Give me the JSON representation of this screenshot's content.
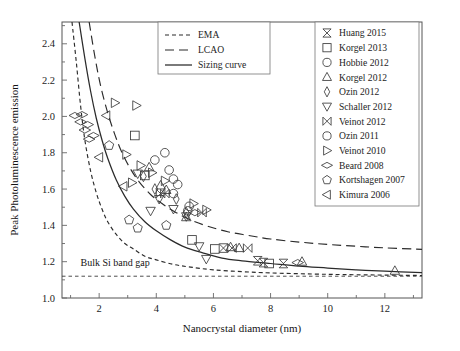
{
  "chart_data": {
    "type": "scatter",
    "title": "",
    "xlabel": "Nanocrystal diameter (nm)",
    "ylabel": "Peak Photoluminescence emission",
    "xlim": [
      0.7,
      13.3
    ],
    "ylim": [
      1.0,
      2.52
    ],
    "xticks": [
      2,
      4,
      6,
      8,
      10,
      12
    ],
    "xtick_labels": [
      "2",
      "4",
      "6",
      "8",
      "10",
      "12"
    ],
    "xminorticks": [
      1,
      3,
      5,
      7,
      9,
      11,
      13
    ],
    "yticks": [
      1.0,
      1.2,
      1.4,
      1.6,
      1.8,
      2.0,
      2.2,
      2.4
    ],
    "ytick_labels": [
      "1.0",
      "1.2",
      "1.4",
      "1.6",
      "1.8",
      "2.0",
      "2.2",
      "2.4"
    ],
    "yminorticks": [
      1.1,
      1.3,
      1.5,
      1.7,
      1.9,
      2.1,
      2.3,
      2.5
    ],
    "grid": false,
    "annotations": [
      {
        "text": "Bulk Si band gap",
        "x": 1.35,
        "y": 1.175
      }
    ],
    "reference_lines": [
      {
        "name": "bulk-si-band-gap",
        "type": "hline",
        "y": 1.12,
        "style": "dotted"
      }
    ],
    "curves": [
      {
        "name": "EMA",
        "style": "dashed-short",
        "points": [
          [
            1.05,
            2.52
          ],
          [
            1.2,
            2.3
          ],
          [
            1.35,
            2.06
          ],
          [
            1.5,
            1.87
          ],
          [
            1.7,
            1.7
          ],
          [
            1.9,
            1.58
          ],
          [
            2.1,
            1.49
          ],
          [
            2.3,
            1.42
          ],
          [
            2.6,
            1.35
          ],
          [
            2.9,
            1.3
          ],
          [
            3.2,
            1.27
          ],
          [
            3.6,
            1.23
          ],
          [
            4.0,
            1.21
          ],
          [
            4.6,
            1.185
          ],
          [
            5.2,
            1.17
          ],
          [
            6.0,
            1.155
          ],
          [
            7.0,
            1.145
          ],
          [
            8.0,
            1.138
          ],
          [
            9.5,
            1.132
          ],
          [
            11.0,
            1.128
          ],
          [
            13.3,
            1.124
          ]
        ]
      },
      {
        "name": "Sizing curve",
        "style": "solid",
        "points": [
          [
            1.3,
            2.52
          ],
          [
            1.5,
            2.32
          ],
          [
            1.7,
            2.14
          ],
          [
            1.9,
            1.99
          ],
          [
            2.1,
            1.87
          ],
          [
            2.3,
            1.77
          ],
          [
            2.6,
            1.65
          ],
          [
            2.9,
            1.56
          ],
          [
            3.2,
            1.49
          ],
          [
            3.6,
            1.42
          ],
          [
            4.0,
            1.37
          ],
          [
            4.5,
            1.32
          ],
          [
            5.0,
            1.28
          ],
          [
            5.6,
            1.25
          ],
          [
            6.3,
            1.22
          ],
          [
            7.0,
            1.205
          ],
          [
            8.0,
            1.19
          ],
          [
            9.0,
            1.175
          ],
          [
            10.0,
            1.165
          ],
          [
            11.0,
            1.155
          ],
          [
            12.0,
            1.148
          ],
          [
            13.3,
            1.14
          ]
        ]
      },
      {
        "name": "LCAO",
        "style": "dashed-long",
        "points": [
          [
            1.65,
            2.52
          ],
          [
            1.85,
            2.33
          ],
          [
            2.05,
            2.17
          ],
          [
            2.3,
            2.02
          ],
          [
            2.55,
            1.9
          ],
          [
            2.8,
            1.8
          ],
          [
            3.1,
            1.71
          ],
          [
            3.4,
            1.64
          ],
          [
            3.8,
            1.57
          ],
          [
            4.2,
            1.52
          ],
          [
            4.7,
            1.47
          ],
          [
            5.2,
            1.43
          ],
          [
            5.8,
            1.395
          ],
          [
            6.5,
            1.365
          ],
          [
            7.2,
            1.345
          ],
          [
            8.0,
            1.325
          ],
          [
            9.0,
            1.308
          ],
          [
            10.0,
            1.295
          ],
          [
            11.0,
            1.285
          ],
          [
            12.0,
            1.276
          ],
          [
            13.3,
            1.268
          ]
        ]
      }
    ],
    "series": [
      {
        "name": "Huang 2015",
        "marker": "bowtie-v",
        "points": [
          [
            6.35,
            1.275
          ],
          [
            7.55,
            1.205
          ],
          [
            7.75,
            1.195
          ],
          [
            8.45,
            1.19
          ]
        ]
      },
      {
        "name": "Korgel 2013",
        "marker": "square",
        "points": [
          [
            3.25,
            1.895
          ],
          [
            3.6,
            1.675
          ],
          [
            5.25,
            1.32
          ],
          [
            6.05,
            1.27
          ],
          [
            7.95,
            1.19
          ]
        ]
      },
      {
        "name": "Hobbie 2012",
        "marker": "circle",
        "points": [
          [
            4.3,
            1.8
          ],
          [
            4.45,
            1.705
          ],
          [
            4.6,
            1.655
          ],
          [
            4.75,
            1.625
          ],
          [
            3.95,
            1.76
          ]
        ]
      },
      {
        "name": "Korgel 2012",
        "marker": "triangle-up",
        "points": [
          [
            3.75,
            1.72
          ],
          [
            4.15,
            1.62
          ],
          [
            4.35,
            1.595
          ],
          [
            5.05,
            1.445
          ],
          [
            6.6,
            1.28
          ],
          [
            6.9,
            1.275
          ],
          [
            9.1,
            1.2
          ],
          [
            12.35,
            1.15
          ]
        ]
      },
      {
        "name": "Ozin 2012",
        "marker": "diamond-narrow",
        "points": [
          [
            3.55,
            1.67
          ],
          [
            3.95,
            1.6
          ],
          [
            4.7,
            1.545
          ],
          [
            5.05,
            1.47
          ]
        ]
      },
      {
        "name": "Schaller 2012",
        "marker": "triangle-down",
        "points": [
          [
            3.35,
            1.685
          ],
          [
            4.1,
            1.545
          ],
          [
            4.6,
            1.49
          ],
          [
            5.05,
            1.45
          ],
          [
            5.5,
            1.285
          ],
          [
            5.75,
            1.215
          ],
          [
            3.8,
            1.48
          ]
        ]
      },
      {
        "name": "Veinot 2012",
        "marker": "bowtie-h",
        "points": [
          [
            4.15,
            1.575
          ],
          [
            4.3,
            1.575
          ],
          [
            5.6,
            1.47
          ],
          [
            6.65,
            1.275
          ],
          [
            7.2,
            1.275
          ]
        ]
      },
      {
        "name": "Ozin 2011",
        "marker": "circle-open",
        "points": [
          [
            4.6,
            1.575
          ],
          [
            5.15,
            1.505
          ],
          [
            5.1,
            1.48
          ]
        ]
      },
      {
        "name": "Veinot 2010",
        "marker": "triangle-right",
        "points": [
          [
            2.55,
            2.075
          ],
          [
            3.3,
            2.06
          ],
          [
            2.95,
            1.79
          ],
          [
            3.45,
            1.73
          ],
          [
            3.85,
            1.69
          ],
          [
            4.3,
            1.645
          ],
          [
            5.3,
            1.52
          ],
          [
            5.75,
            1.485
          ],
          [
            3.15,
            1.635
          ]
        ]
      },
      {
        "name": "Beard 2008",
        "marker": "diamond-wide",
        "points": [
          [
            1.15,
            2.005
          ],
          [
            1.35,
            1.97
          ],
          [
            1.5,
            1.925
          ],
          [
            1.65,
            1.875
          ],
          [
            1.4,
            2.01
          ],
          [
            1.6,
            1.955
          ],
          [
            1.8,
            1.895
          ],
          [
            5.35,
            1.47
          ],
          [
            8.95,
            1.195
          ]
        ]
      },
      {
        "name": "Kortshagen 2007",
        "marker": "pentagon",
        "points": [
          [
            2.35,
            1.84
          ],
          [
            3.05,
            1.43
          ],
          [
            4.35,
            1.4
          ],
          [
            3.35,
            1.385
          ]
        ]
      },
      {
        "name": "Kimura 2006",
        "marker": "triangle-left",
        "points": [
          [
            2.25,
            2.005
          ],
          [
            2.0,
            1.775
          ],
          [
            2.85,
            1.615
          ]
        ]
      }
    ],
    "curve_legend": [
      {
        "label": "EMA",
        "style": "dashed-short"
      },
      {
        "label": "LCAO",
        "style": "dashed-long"
      },
      {
        "label": "Sizing curve",
        "style": "solid"
      }
    ],
    "marker_legend": [
      {
        "label": "Huang 2015",
        "marker": "bowtie-v"
      },
      {
        "label": "Korgel 2013",
        "marker": "square"
      },
      {
        "label": "Hobbie 2012",
        "marker": "circle"
      },
      {
        "label": "Korgel 2012",
        "marker": "triangle-up"
      },
      {
        "label": "Ozin 2012",
        "marker": "diamond-narrow"
      },
      {
        "label": "Schaller 2012",
        "marker": "triangle-down"
      },
      {
        "label": "Veinot 2012",
        "marker": "bowtie-h"
      },
      {
        "label": "Ozin 2011",
        "marker": "circle-open"
      },
      {
        "label": "Veinot 2010",
        "marker": "triangle-right"
      },
      {
        "label": "Beard 2008",
        "marker": "diamond-wide"
      },
      {
        "label": "Kortshagen 2007",
        "marker": "pentagon"
      },
      {
        "label": "Kimura 2006",
        "marker": "triangle-left"
      }
    ],
    "colors": {
      "ink": "#2b2b2b",
      "axis": "#555555",
      "marker": "#3a3a3a",
      "background": "#ffffff"
    }
  }
}
